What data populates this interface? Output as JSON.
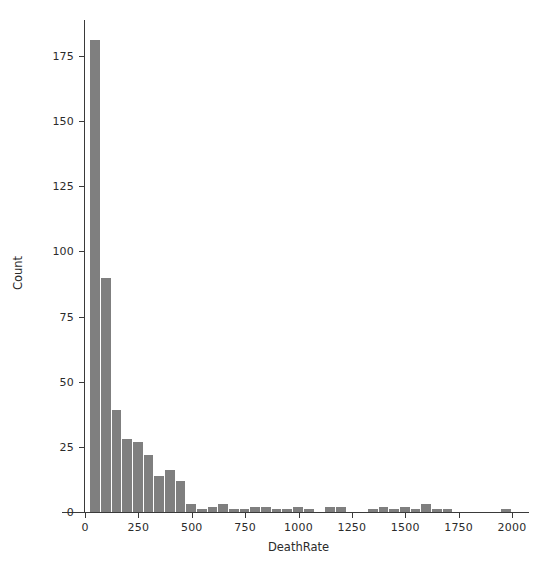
{
  "chart_data": {
    "type": "bar",
    "title": "",
    "subtitle": "",
    "xlabel": "DeathRate",
    "ylabel": "Count",
    "xlim": [
      -60,
      2060
    ],
    "ylim": [
      0,
      192
    ],
    "grid": false,
    "legend": null,
    "bin_width": 50,
    "bar_color": "#7f7f7f",
    "axis_color": "#3a3a3a",
    "xticks": [
      0,
      250,
      500,
      750,
      1000,
      1250,
      1500,
      1750,
      2000
    ],
    "xtick_labels": [
      "0",
      "250",
      "500",
      "750",
      "1000",
      "1250",
      "1500",
      "1750",
      "2000"
    ],
    "yticks": [
      0,
      25,
      50,
      75,
      100,
      125,
      150,
      175
    ],
    "ytick_labels": [
      "0",
      "25",
      "50",
      "75",
      "100",
      "125",
      "150",
      "175"
    ],
    "bins": [
      {
        "x0": 25,
        "x1": 75,
        "center": 50,
        "value": 181
      },
      {
        "x0": 75,
        "x1": 125,
        "center": 100,
        "value": 90
      },
      {
        "x0": 125,
        "x1": 175,
        "center": 150,
        "value": 39
      },
      {
        "x0": 175,
        "x1": 225,
        "center": 200,
        "value": 28
      },
      {
        "x0": 225,
        "x1": 275,
        "center": 250,
        "value": 27
      },
      {
        "x0": 275,
        "x1": 325,
        "center": 300,
        "value": 22
      },
      {
        "x0": 325,
        "x1": 375,
        "center": 350,
        "value": 14
      },
      {
        "x0": 375,
        "x1": 425,
        "center": 400,
        "value": 16
      },
      {
        "x0": 425,
        "x1": 475,
        "center": 450,
        "value": 12
      },
      {
        "x0": 475,
        "x1": 525,
        "center": 500,
        "value": 3
      },
      {
        "x0": 525,
        "x1": 575,
        "center": 550,
        "value": 1
      },
      {
        "x0": 575,
        "x1": 625,
        "center": 600,
        "value": 2
      },
      {
        "x0": 625,
        "x1": 675,
        "center": 650,
        "value": 3
      },
      {
        "x0": 675,
        "x1": 725,
        "center": 700,
        "value": 1
      },
      {
        "x0": 725,
        "x1": 775,
        "center": 750,
        "value": 1
      },
      {
        "x0": 775,
        "x1": 825,
        "center": 800,
        "value": 2
      },
      {
        "x0": 825,
        "x1": 875,
        "center": 850,
        "value": 2
      },
      {
        "x0": 875,
        "x1": 925,
        "center": 900,
        "value": 1
      },
      {
        "x0": 925,
        "x1": 975,
        "center": 950,
        "value": 1
      },
      {
        "x0": 975,
        "x1": 1025,
        "center": 1000,
        "value": 2
      },
      {
        "x0": 1025,
        "x1": 1075,
        "center": 1050,
        "value": 1
      },
      {
        "x0": 1125,
        "x1": 1175,
        "center": 1150,
        "value": 2
      },
      {
        "x0": 1175,
        "x1": 1225,
        "center": 1200,
        "value": 2
      },
      {
        "x0": 1325,
        "x1": 1375,
        "center": 1350,
        "value": 1
      },
      {
        "x0": 1375,
        "x1": 1425,
        "center": 1400,
        "value": 2
      },
      {
        "x0": 1425,
        "x1": 1475,
        "center": 1450,
        "value": 1
      },
      {
        "x0": 1475,
        "x1": 1525,
        "center": 1500,
        "value": 2
      },
      {
        "x0": 1525,
        "x1": 1575,
        "center": 1550,
        "value": 1
      },
      {
        "x0": 1575,
        "x1": 1625,
        "center": 1600,
        "value": 3
      },
      {
        "x0": 1625,
        "x1": 1675,
        "center": 1650,
        "value": 1
      },
      {
        "x0": 1675,
        "x1": 1725,
        "center": 1700,
        "value": 1
      },
      {
        "x0": 1950,
        "x1": 2000,
        "center": 1975,
        "value": 1
      }
    ]
  }
}
